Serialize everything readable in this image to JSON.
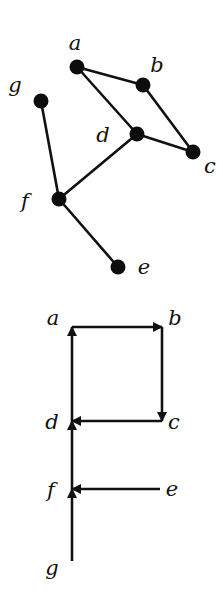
{
  "figure": {
    "undirected_graph": {
      "title": "",
      "nodes": [
        {
          "id": "a",
          "label": "a",
          "x": 77,
          "y": 67,
          "lx": 75,
          "ly": 50
        },
        {
          "id": "b",
          "label": "b",
          "x": 143,
          "y": 85,
          "lx": 157,
          "ly": 72
        },
        {
          "id": "c",
          "label": "c",
          "x": 193,
          "y": 152,
          "lx": 210,
          "ly": 173
        },
        {
          "id": "d",
          "label": "d",
          "x": 137,
          "y": 134,
          "lx": 103,
          "ly": 142
        },
        {
          "id": "e",
          "label": "e",
          "x": 118,
          "y": 267,
          "lx": 144,
          "ly": 274
        },
        {
          "id": "f",
          "label": "f",
          "x": 59,
          "y": 199,
          "lx": 25,
          "ly": 208
        },
        {
          "id": "g",
          "label": "g",
          "x": 41,
          "y": 101,
          "lx": 15,
          "ly": 92
        }
      ],
      "edges": [
        [
          "a",
          "b"
        ],
        [
          "a",
          "d"
        ],
        [
          "b",
          "c"
        ],
        [
          "d",
          "c"
        ],
        [
          "d",
          "f"
        ],
        [
          "g",
          "f"
        ],
        [
          "f",
          "e"
        ]
      ]
    },
    "directed_graph": {
      "title": "",
      "nodes": [
        {
          "id": "a",
          "label": "a",
          "x": 72,
          "y": 327,
          "lx": 53,
          "ly": 325
        },
        {
          "id": "b",
          "label": "b",
          "x": 162,
          "y": 327,
          "lx": 175,
          "ly": 325
        },
        {
          "id": "c",
          "label": "c",
          "x": 162,
          "y": 421,
          "lx": 174,
          "ly": 429
        },
        {
          "id": "d",
          "label": "d",
          "x": 72,
          "y": 421,
          "lx": 52,
          "ly": 429
        },
        {
          "id": "e",
          "label": "e",
          "x": 160,
          "y": 489,
          "lx": 172,
          "ly": 496
        },
        {
          "id": "f",
          "label": "f",
          "x": 72,
          "y": 489,
          "lx": 51,
          "ly": 497
        },
        {
          "id": "g",
          "label": "g",
          "x": 72,
          "y": 561,
          "lx": 52,
          "ly": 575
        }
      ],
      "arcs": [
        {
          "from": "a",
          "to": "b"
        },
        {
          "from": "b",
          "to": "c"
        },
        {
          "from": "c",
          "to": "d"
        },
        {
          "from": "d",
          "to": "a"
        },
        {
          "from": "f",
          "to": "d"
        },
        {
          "from": "e",
          "to": "f"
        },
        {
          "from": "g",
          "to": "f"
        }
      ]
    },
    "colors": {
      "ink": "#111111",
      "background": "#ffffff"
    }
  }
}
